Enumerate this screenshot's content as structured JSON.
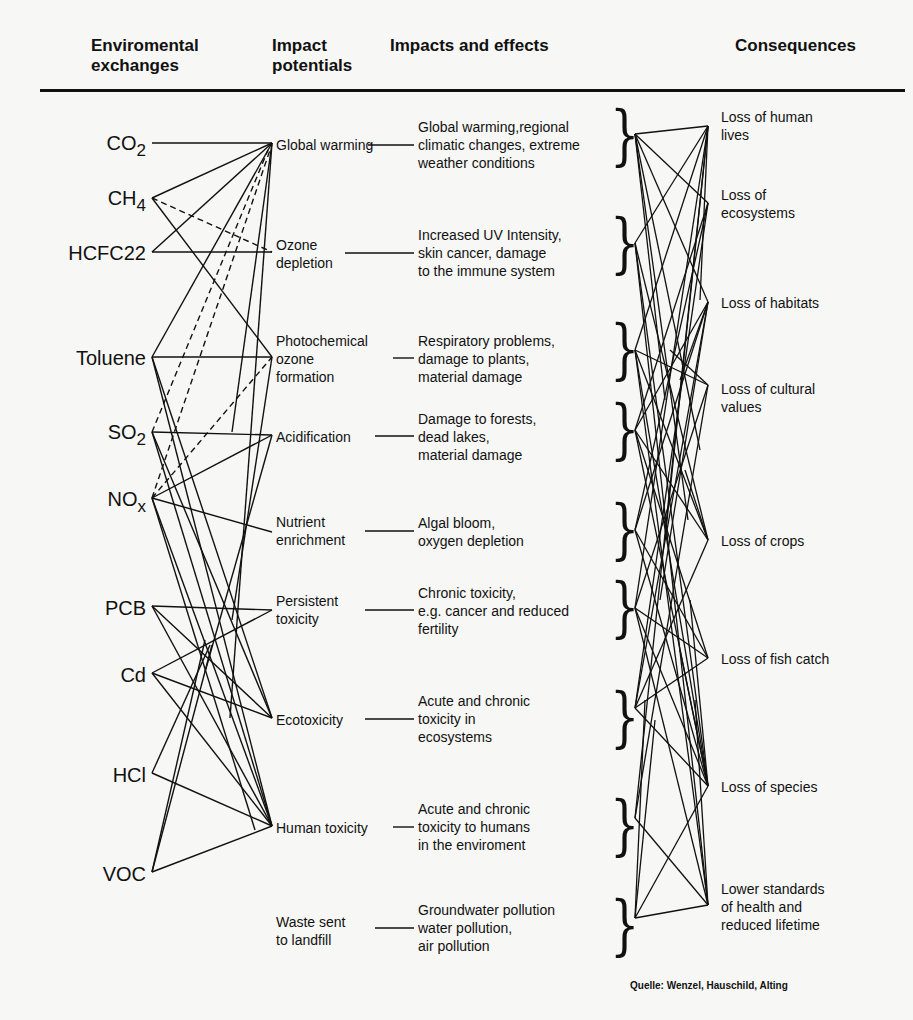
{
  "headers": {
    "col1": "Enviromental exchanges",
    "col2": "Impact potentials",
    "col3": "Impacts and effects",
    "col4": "Consequences"
  },
  "substances": [
    {
      "base": "CO",
      "sub": "2"
    },
    {
      "base": "CH",
      "sub": "4"
    },
    {
      "base": "HCFC22",
      "sub": ""
    },
    {
      "base": "Toluene",
      "sub": ""
    },
    {
      "base": "SO",
      "sub": "2"
    },
    {
      "base": "NO",
      "sub": "x"
    },
    {
      "base": "PCB",
      "sub": ""
    },
    {
      "base": "Cd",
      "sub": ""
    },
    {
      "base": "HCl",
      "sub": ""
    },
    {
      "base": "VOC",
      "sub": ""
    }
  ],
  "impact_potentials": [
    "Global warming",
    "Ozone depletion",
    "Photochemical ozone formation",
    "Acidification",
    "Nutrient enrichment",
    "Persistent toxicity",
    "Ecotoxicity",
    "Human toxicity",
    "Waste sent to landfill"
  ],
  "effects": [
    "Global warming,regional climatic changes, extreme weather conditions",
    "Increased UV Intensity, skin cancer, damage to the immune system",
    "Respiratory problems, damage to plants, material damage",
    "Damage to forests, dead lakes, material damage",
    "Algal bloom, oxygen depletion",
    "Chronic toxicity, e.g. cancer and reduced fertility",
    "Acute and chronic toxicity in ecosystems",
    "Acute and chronic toxicity to humans in the enviroment",
    "Groundwater pollution water pollution, air pollution"
  ],
  "effects_lines": [
    [
      "Global warming,regional",
      "climatic changes, extreme",
      "weather conditions"
    ],
    [
      "Increased UV Intensity,",
      "skin cancer, damage",
      "to the immune system"
    ],
    [
      "Respiratory problems,",
      "damage to plants,",
      "material damage"
    ],
    [
      "Damage to forests,",
      "dead lakes,",
      "material damage"
    ],
    [
      "Algal bloom,",
      "oxygen depletion"
    ],
    [
      "Chronic toxicity,",
      "e.g. cancer and reduced",
      "fertility"
    ],
    [
      "Acute and chronic",
      "toxicity in",
      "ecosystems"
    ],
    [
      "Acute and chronic",
      "toxicity to humans",
      "in the enviroment"
    ],
    [
      "Groundwater pollution",
      "water pollution,",
      "air pollution"
    ]
  ],
  "impact_lines": [
    [
      "Global warming"
    ],
    [
      "Ozone",
      "depletion"
    ],
    [
      "Photochemical",
      "ozone",
      "formation"
    ],
    [
      "Acidification"
    ],
    [
      "Nutrient",
      "enrichment"
    ],
    [
      "Persistent",
      "toxicity"
    ],
    [
      "Ecotoxicity"
    ],
    [
      "Human toxicity"
    ],
    [
      "Waste sent",
      "to landfill"
    ]
  ],
  "consequences": [
    [
      "Loss of human",
      "lives"
    ],
    [
      "Loss of",
      "ecosystems"
    ],
    [
      "Loss of habitats"
    ],
    [
      "Loss of cultural",
      "values"
    ],
    [
      "Loss of crops"
    ],
    [
      "Loss of fish catch"
    ],
    [
      "Loss of species"
    ],
    [
      "Lower standards",
      "of health and",
      "reduced lifetime"
    ]
  ],
  "source": "Quelle: Wenzel, Hauschild, Alting",
  "colors": {
    "ink": "#111111",
    "background": "#f7f7f5"
  }
}
